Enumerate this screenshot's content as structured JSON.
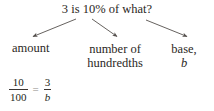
{
  "figure": {
    "question": "3 is 10% of what?",
    "labels": {
      "amount": "amount",
      "hundredths_line1": "number of",
      "hundredths_line2": "hundredths",
      "base_line1": "base,",
      "base_line2": "b"
    },
    "equation": {
      "left_numerator": "10",
      "left_denominator": "100",
      "equals": "=",
      "right_numerator": "3",
      "right_denominator": "b"
    },
    "colors": {
      "text": "#2b2724",
      "arrow": "#55504d",
      "background": "#ffffff"
    },
    "arrows": [
      {
        "name": "arrow-to-amount",
        "from_x": 76,
        "from_y": 19,
        "to_x": 32,
        "to_y": 37
      },
      {
        "name": "arrow-to-hundredths",
        "from_x": 92,
        "from_y": 19,
        "to_x": 118,
        "to_y": 37
      },
      {
        "name": "arrow-to-base",
        "from_x": 146,
        "from_y": 20,
        "to_x": 188,
        "to_y": 37
      }
    ]
  }
}
